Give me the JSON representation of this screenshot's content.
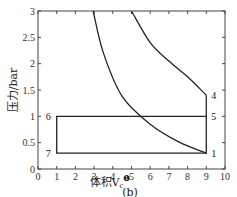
{
  "chart_data": {
    "type": "line",
    "title": "",
    "caption": "(b)",
    "xlabel": "体积V",
    "xlabel_subscript": "c",
    "xlabel_marker": "❶",
    "ylabel": "压力/bar",
    "xlim": [
      0,
      10
    ],
    "ylim": [
      0,
      3
    ],
    "xticks": [
      "0",
      "1",
      "2",
      "3",
      "4",
      "5",
      "6",
      "7",
      "8",
      "9",
      "10"
    ],
    "yticks": [
      "0",
      "0.5",
      "1",
      "1.5",
      "2",
      "2.5",
      "3"
    ],
    "grid": false,
    "series": [
      {
        "name": "isentrope-upper",
        "x": [
          5.0,
          6.0,
          7.0,
          8.0,
          9.0
        ],
        "y": [
          3.0,
          2.4,
          2.05,
          1.75,
          1.4
        ]
      },
      {
        "name": "isentrope-lower",
        "x": [
          2.95,
          3.5,
          4.5,
          6.0,
          7.5,
          9.0
        ],
        "y": [
          3.0,
          2.2,
          1.38,
          0.85,
          0.52,
          0.3
        ]
      },
      {
        "name": "cycle-path",
        "points": [
          {
            "label": "1",
            "x": 9,
            "y": 0.3
          },
          {
            "label": "4",
            "x": 9,
            "y": 1.4
          },
          {
            "label": "5",
            "x": 9,
            "y": 1.0
          },
          {
            "label": "6",
            "x": 1,
            "y": 1.0
          },
          {
            "label": "7",
            "x": 1,
            "y": 0.3
          }
        ]
      }
    ],
    "point_labels": [
      {
        "text": "1",
        "x": 9,
        "y": 0.3
      },
      {
        "text": "4",
        "x": 9,
        "y": 1.4
      },
      {
        "text": "5",
        "x": 9,
        "y": 1.0
      },
      {
        "text": "6",
        "x": 1,
        "y": 1.0
      },
      {
        "text": "7",
        "x": 1,
        "y": 0.3
      }
    ]
  }
}
